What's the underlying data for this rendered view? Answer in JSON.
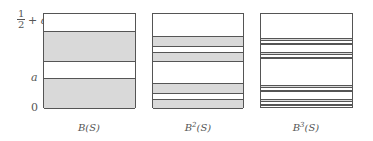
{
  "figure": {
    "y_labels": {
      "top_numerator": "1",
      "top_denominator": "2",
      "top_suffix": "+ a",
      "middle": "a",
      "bottom": "0"
    },
    "panels": [
      {
        "caption_base": "B",
        "caption_sup": "",
        "caption_arg": "(S)",
        "bands": [
          [
            17,
            48
          ],
          [
            64,
            95
          ]
        ]
      },
      {
        "caption_base": "B",
        "caption_sup": "2",
        "caption_arg": "(S)",
        "bands": [
          [
            22,
            33
          ],
          [
            38,
            48
          ],
          [
            69,
            80
          ],
          [
            85,
            95
          ]
        ]
      },
      {
        "caption_base": "B",
        "caption_sup": "3",
        "caption_arg": "(S)",
        "bands": [
          [
            24,
            27
          ],
          [
            29,
            31
          ],
          [
            38,
            41
          ],
          [
            43,
            45
          ],
          [
            71,
            74
          ],
          [
            76,
            78
          ],
          [
            85,
            88
          ],
          [
            90,
            92
          ]
        ]
      }
    ]
  }
}
